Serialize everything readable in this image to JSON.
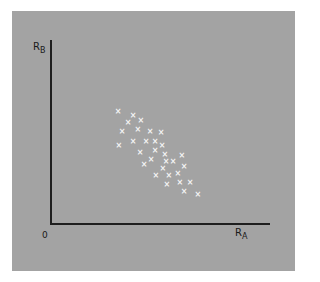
{
  "chart_data": {
    "type": "scatter",
    "title": "",
    "xlabel": "R_A",
    "ylabel": "R_B",
    "origin_label": "0",
    "xlim": [
      0,
      1
    ],
    "ylim": [
      0,
      1
    ],
    "grid": false,
    "legend": null,
    "marker": "x",
    "marker_color": "#f4f4f4",
    "background_color": "#a3a3a3",
    "axis_color": "#1e1e1e",
    "note": "No numeric tick labels shown; coordinates are normalized to axis length (0=origin, 1=axis end). Points show a negative correlation between R_A and R_B.",
    "points": [
      {
        "x": 0.305,
        "y": 0.614
      },
      {
        "x": 0.373,
        "y": 0.592
      },
      {
        "x": 0.35,
        "y": 0.554
      },
      {
        "x": 0.409,
        "y": 0.56
      },
      {
        "x": 0.323,
        "y": 0.505
      },
      {
        "x": 0.395,
        "y": 0.511
      },
      {
        "x": 0.45,
        "y": 0.505
      },
      {
        "x": 0.5,
        "y": 0.495
      },
      {
        "x": 0.309,
        "y": 0.429
      },
      {
        "x": 0.373,
        "y": 0.451
      },
      {
        "x": 0.432,
        "y": 0.451
      },
      {
        "x": 0.473,
        "y": 0.451
      },
      {
        "x": 0.505,
        "y": 0.424
      },
      {
        "x": 0.473,
        "y": 0.402
      },
      {
        "x": 0.405,
        "y": 0.391
      },
      {
        "x": 0.518,
        "y": 0.38
      },
      {
        "x": 0.595,
        "y": 0.37
      },
      {
        "x": 0.455,
        "y": 0.353
      },
      {
        "x": 0.523,
        "y": 0.337
      },
      {
        "x": 0.555,
        "y": 0.337
      },
      {
        "x": 0.423,
        "y": 0.326
      },
      {
        "x": 0.605,
        "y": 0.31
      },
      {
        "x": 0.509,
        "y": 0.299
      },
      {
        "x": 0.577,
        "y": 0.277
      },
      {
        "x": 0.477,
        "y": 0.266
      },
      {
        "x": 0.536,
        "y": 0.261
      },
      {
        "x": 0.586,
        "y": 0.223
      },
      {
        "x": 0.632,
        "y": 0.223
      },
      {
        "x": 0.527,
        "y": 0.212
      },
      {
        "x": 0.605,
        "y": 0.179
      },
      {
        "x": 0.668,
        "y": 0.163
      }
    ]
  },
  "labels": {
    "y_main": "R",
    "y_sub": "B",
    "x_main": "R",
    "x_sub": "A",
    "origin": "0",
    "marker_glyph": "×"
  }
}
